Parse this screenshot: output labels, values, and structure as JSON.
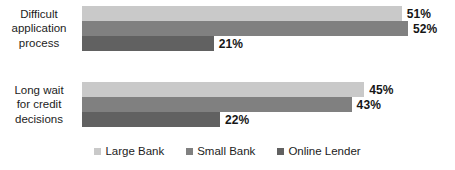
{
  "chart_data": {
    "type": "bar",
    "orientation": "horizontal",
    "title": "",
    "subtitle": "",
    "xlabel": "",
    "ylabel": "",
    "grid": false,
    "axis_visible": false,
    "value_suffix": "%",
    "xlim": [
      0,
      52
    ],
    "legend_position": "bottom-center",
    "categories": [
      "Difficult\napplication\nprocess",
      "Long wait\nfor credit\ndecisions"
    ],
    "series": [
      {
        "name": "Large Bank",
        "color": "#c9c9c9",
        "values": [
          51,
          45
        ],
        "labels": [
          "51%",
          "45%"
        ]
      },
      {
        "name": "Small Bank",
        "color": "#808080",
        "values": [
          52,
          43
        ],
        "labels": [
          "52%",
          "43%"
        ]
      },
      {
        "name": "Online Lender",
        "color": "#616161",
        "values": [
          21,
          22
        ],
        "labels": [
          "21%",
          "22%"
        ]
      }
    ]
  },
  "legend": {
    "items": [
      {
        "label": "Large Bank",
        "color": "#c9c9c9"
      },
      {
        "label": "Small Bank",
        "color": "#808080"
      },
      {
        "label": "Online Lender",
        "color": "#616161"
      }
    ]
  },
  "scale": {
    "px_per_unit": 6.27,
    "bar_origin_x": 82
  }
}
